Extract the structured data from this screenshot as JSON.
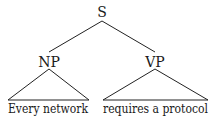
{
  "tree": {
    "root": {
      "label": "S",
      "children": [
        {
          "label": "NP",
          "leaf_text": "Every network"
        },
        {
          "label": "VP",
          "leaf_text": "requires a protocol"
        }
      ]
    }
  },
  "colors": {
    "ink": "#1a1a1a",
    "background": "#ffffff"
  }
}
